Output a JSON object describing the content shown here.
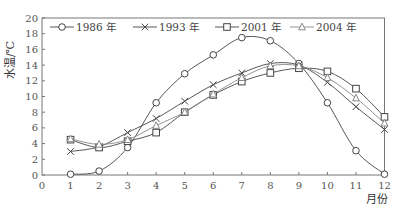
{
  "chart_data": {
    "type": "line",
    "title": "",
    "xlabel": "月份",
    "ylabel": "水温/℃",
    "xlim": [
      0,
      12
    ],
    "ylim": [
      0,
      20
    ],
    "x_ticks": [
      0,
      1,
      2,
      3,
      4,
      5,
      6,
      7,
      8,
      9,
      10,
      11,
      12
    ],
    "y_ticks": [
      0,
      2,
      4,
      6,
      8,
      10,
      12,
      14,
      16,
      18,
      20
    ],
    "grid": false,
    "legend_position": "top-inside",
    "x": [
      1,
      2,
      3,
      4,
      5,
      6,
      7,
      8,
      9,
      10,
      11,
      12
    ],
    "series": [
      {
        "name": "1986 年",
        "marker": "circle",
        "color": "#444444",
        "values": [
          0.1,
          0.5,
          3.5,
          9.2,
          12.9,
          15.3,
          17.5,
          17.1,
          14.2,
          9.2,
          3.1,
          0.1
        ]
      },
      {
        "name": "1993 年",
        "marker": "x",
        "color": "#444444",
        "values": [
          3.0,
          3.6,
          5.4,
          7.2,
          9.4,
          11.5,
          13.0,
          14.2,
          14.0,
          11.8,
          8.7,
          5.8
        ]
      },
      {
        "name": "2001 年",
        "marker": "square",
        "color": "#444444",
        "values": [
          4.5,
          3.5,
          4.3,
          5.4,
          8.0,
          10.2,
          11.9,
          13.0,
          13.6,
          13.2,
          11.0,
          7.4
        ]
      },
      {
        "name": "2004 年",
        "marker": "triangle",
        "color": "#888888",
        "values": [
          4.6,
          3.9,
          4.5,
          6.3,
          8.0,
          10.3,
          12.4,
          13.9,
          13.9,
          12.4,
          9.8,
          6.6
        ]
      }
    ]
  }
}
